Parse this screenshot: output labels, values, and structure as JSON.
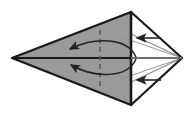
{
  "figure": {
    "type": "origami-instruction-diagram",
    "width": 195,
    "height": 116,
    "background_color": "#ffffff"
  },
  "colors": {
    "paper_front_gray": "#9a9a9a",
    "paper_back_white": "#ffffff",
    "outline_dark": "#1a1a1a",
    "thin_line_gray": "#8c8c8c",
    "fold_line_dashed": "#5a5a5a",
    "arrow_dark": "#222222"
  },
  "geometry": {
    "vertices": {
      "left_point": {
        "x": 12,
        "y": 58
      },
      "top_point": {
        "x": 131,
        "y": 12
      },
      "bottom_point": {
        "x": 131,
        "y": 105
      },
      "right_point": {
        "x": 182,
        "y": 58
      },
      "center_top": {
        "x": 131,
        "y": 12
      },
      "center_bottom": {
        "x": 131,
        "y": 105
      }
    },
    "gray_kite_path": "M 12 58 L 131 12 L 131 105 Z",
    "white_upper_triangle_path": "M 131 12 L 182 58 L 131 58 Z",
    "white_lower_triangle_path": "M 131 105 L 182 58 L 131 58 Z",
    "horizontal_center_line": {
      "x1": 12,
      "y1": 58,
      "x2": 182,
      "y2": 58
    },
    "vertical_center_line": {
      "x1": 131,
      "y1": 12,
      "x2": 131,
      "y2": 105
    },
    "dashed_fold_line": {
      "x": 100,
      "y1": 30,
      "y2": 88
    },
    "thin_ray_upper": {
      "x1": 182,
      "y1": 58,
      "x2": 131,
      "y2": 34
    },
    "thin_ray_lower": {
      "x1": 182,
      "y1": 58,
      "x2": 131,
      "y2": 82
    },
    "thin_ray_upper_inner": {
      "x1": 182,
      "y1": 58,
      "x2": 124,
      "y2": 38
    },
    "thin_ray_lower_inner": {
      "x1": 182,
      "y1": 58,
      "x2": 124,
      "y2": 78
    }
  },
  "annotations": {
    "curved_arrow_upper": {
      "name": "fold-arrow-upper",
      "direction": "right-to-left",
      "path": "M 136 57 C 128 38, 96 36, 70 49",
      "arrowhead_at": {
        "x": 70,
        "y": 49
      },
      "arrowhead_angle": -155
    },
    "curved_arrow_lower": {
      "name": "fold-arrow-lower",
      "direction": "right-to-left",
      "path": "M 136 59 C 128 78, 96 79, 71 65",
      "arrowhead_at": {
        "x": 71,
        "y": 65
      },
      "arrowhead_angle": 152
    },
    "straight_arrow_upper": {
      "name": "push-arrow-upper",
      "direction": "left",
      "x_start": 161,
      "x_end": 137,
      "y": 38
    },
    "straight_arrow_lower": {
      "name": "push-arrow-lower",
      "direction": "left",
      "x_start": 161,
      "x_end": 137,
      "y": 80
    }
  },
  "labels": {
    "caption": ""
  }
}
